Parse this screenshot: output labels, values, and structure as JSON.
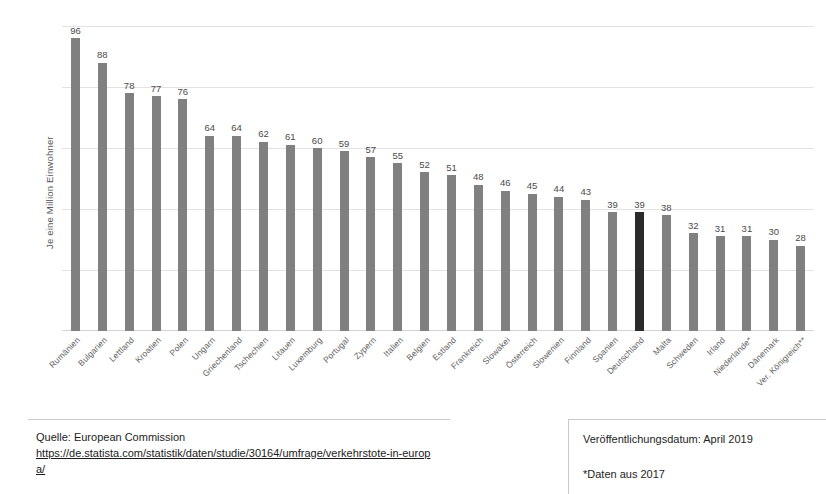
{
  "chart_data": {
    "type": "bar",
    "title": "",
    "xlabel": "",
    "ylabel": "Je eine Million Einwohner",
    "ylim": [
      0,
      100
    ],
    "grid": true,
    "gridlines": [
      20,
      40,
      60,
      80,
      100
    ],
    "legend": "none",
    "highlight_category": "Deutschland",
    "highlight_color": "#2b2b2b",
    "bar_color": "#808080",
    "categories": [
      "Rumänien",
      "Bulgarien",
      "Lettland",
      "Kroatien",
      "Polen",
      "Ungarn",
      "Griechenland",
      "Tschechien",
      "Litauen",
      "Luxemburg",
      "Portugal",
      "Zypern",
      "Italien",
      "Belgien",
      "Estland",
      "Frankreich",
      "Slowakei",
      "Österreich",
      "Slowenien",
      "Finnland",
      "Spanien",
      "Deutschland",
      "Malta",
      "Schweden",
      "Irland",
      "Niederlande*",
      "Dänemark",
      "Ver. Königreich**"
    ],
    "values": [
      96,
      88,
      78,
      77,
      76,
      64,
      64,
      62,
      61,
      60,
      59,
      57,
      55,
      52,
      51,
      48,
      46,
      45,
      44,
      43,
      39,
      39,
      38,
      32,
      31,
      31,
      30,
      28
    ]
  },
  "footer": {
    "source_label": "Quelle: European Commission",
    "source_url": "https://de.statista.com/statistik/daten/studie/30164/umfrage/verkehrstote-in-europa/",
    "publication_date": "Veröffentlichungsdatum: April 2019",
    "data_note": "*Daten aus 2017"
  }
}
